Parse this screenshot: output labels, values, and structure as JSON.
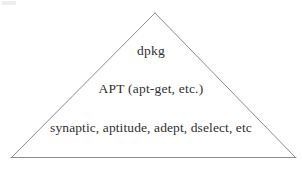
{
  "figure": {
    "type": "layered-triangle-diagram",
    "background_color": "#ffffff",
    "outline_color": "#8c8c8c",
    "text_color": "#30302f",
    "layers": [
      {
        "id": "top",
        "label": "dpkg"
      },
      {
        "id": "middle",
        "label": "APT (apt-get, etc.)"
      },
      {
        "id": "bottom",
        "label": "synaptic, aptitude, adept, dselect, etc"
      }
    ]
  }
}
